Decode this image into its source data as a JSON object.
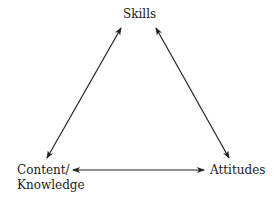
{
  "diagram": {
    "type": "triangle-relationship",
    "nodes": [
      {
        "id": "skills",
        "label": "Skills"
      },
      {
        "id": "content",
        "label_line1": "Content/",
        "label_line2": "Knowledge"
      },
      {
        "id": "attitudes",
        "label": "Attitudes"
      }
    ],
    "edges": [
      {
        "from": "content",
        "to": "skills",
        "direction": "bidirectional"
      },
      {
        "from": "skills",
        "to": "attitudes",
        "direction": "bidirectional"
      },
      {
        "from": "content",
        "to": "attitudes",
        "direction": "bidirectional"
      }
    ],
    "colors": {
      "line": "#222222",
      "text": "#1a1a1a",
      "background": "#ffffff"
    }
  }
}
